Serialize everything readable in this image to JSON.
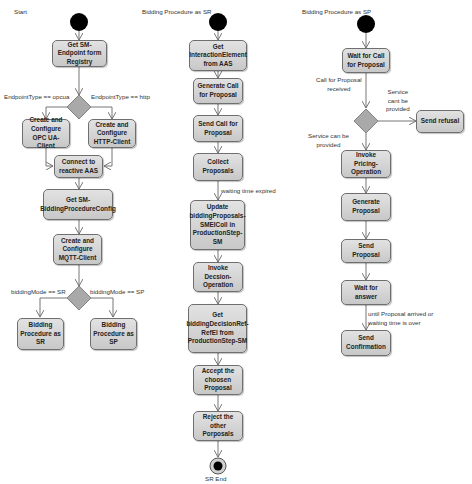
{
  "diagram": {
    "type": "UML activity diagram",
    "colors": {
      "node_fill": "#d4d4d4",
      "node_border": "#6f6f6f",
      "edge": "#666666",
      "start": "#000000",
      "decision": "#a9a9a9"
    }
  },
  "lanes": [
    {
      "title": "Start",
      "nodes": [
        {
          "id": "c1n1",
          "label": "Get SM-Endpoint form Registry"
        },
        {
          "id": "c1n2",
          "label": "Create and Configure OPC UA-Client"
        },
        {
          "id": "c1n3",
          "label": "Create and Configure HTTP-Client"
        },
        {
          "id": "c1n4",
          "label": "Connect to reactive AAS"
        },
        {
          "id": "c1n5",
          "label": "Get SM-BiddingProcedureConfig"
        },
        {
          "id": "c1n6",
          "label": "Create and Configure MQTT-Client"
        },
        {
          "id": "c1n7",
          "label": "Bidding Procedure as SR"
        },
        {
          "id": "c1n8",
          "label": "Bidding Procedure as SP"
        }
      ],
      "guards": [
        "EndpointType == opcua",
        "EndpointType == http",
        "biddingMode == SR",
        "biddingMode == SP"
      ]
    },
    {
      "title": "Bidding Procedure as SR",
      "nodes": [
        {
          "id": "c2n1",
          "label": "Get InteractionElement from AAS"
        },
        {
          "id": "c2n2",
          "label": "Generate Call for Proposal"
        },
        {
          "id": "c2n3",
          "label": "Send Call for Proposal"
        },
        {
          "id": "c2n4",
          "label": "Collect Proposals"
        },
        {
          "id": "c2n5",
          "label": "Update biddingProposals-SMEIColl in ProductionStep-SM"
        },
        {
          "id": "c2n6",
          "label": "Invoke Decsion-Operation"
        },
        {
          "id": "c2n7",
          "label": "Get biddingDecisionRef-RefEl from ProductionStep-SM"
        },
        {
          "id": "c2n8",
          "label": "Accept the choosen Proposal"
        },
        {
          "id": "c2n9",
          "label": "Reject the other Porposals"
        }
      ],
      "guards": [
        "waiting time expired"
      ],
      "end_label": "SR End"
    },
    {
      "title": "Bidding Procedure as SP",
      "nodes": [
        {
          "id": "c3n1",
          "label": "Wait for Call for Proposal"
        },
        {
          "id": "c3n2",
          "label": "Send refusal"
        },
        {
          "id": "c3n3",
          "label": "Invoke Pricing-Operation"
        },
        {
          "id": "c3n4",
          "label": "Generate Proposal"
        },
        {
          "id": "c3n5",
          "label": "Send Proposal"
        },
        {
          "id": "c3n6",
          "label": "Wait for answer"
        },
        {
          "id": "c3n7",
          "label": "Send Confirmation"
        }
      ],
      "guards": [
        "Call for Proposal\nreceived",
        "Service\ncant be\nprovided",
        "Service can be\nprovided",
        "until Proposal arrived or\nwaiting time is over"
      ]
    }
  ]
}
